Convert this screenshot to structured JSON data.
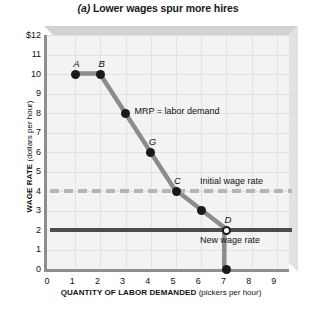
{
  "chart_data": {
    "type": "line",
    "title": "(a) Lower wages spur more hires",
    "title_prefix": "(a)",
    "title_rest": " Lower wages spur more hires",
    "xlabel_strong": "QUANTITY OF LABOR DEMANDED",
    "xlabel_unit": " (pickers per hour)",
    "ylabel_strong": "WAGE RATE",
    "ylabel_unit": " (dollars per hour)",
    "xlim": [
      0,
      9.6
    ],
    "ylim": [
      0,
      12
    ],
    "xticks": [
      "0",
      "1",
      "2",
      "3",
      "4",
      "5",
      "6",
      "7",
      "8",
      "9"
    ],
    "yticks": [
      "$12",
      "11",
      "10",
      "9",
      "8",
      "7",
      "6",
      "5",
      "4",
      "3",
      "2",
      "1",
      "0"
    ],
    "grid": true,
    "legend": "none",
    "series": [
      {
        "name": "MRP = labor demand",
        "color": "#8c8c8c",
        "x": [
          1,
          2,
          3,
          4,
          5,
          6,
          7,
          7
        ],
        "y": [
          10,
          10,
          8,
          6,
          4,
          3,
          2,
          0
        ]
      }
    ],
    "points": [
      {
        "label": "A",
        "x": 1,
        "y": 10,
        "style": "filled"
      },
      {
        "label": "B",
        "x": 2,
        "y": 10,
        "style": "filled"
      },
      {
        "label": "",
        "x": 3,
        "y": 8,
        "style": "filled"
      },
      {
        "label": "G",
        "x": 4,
        "y": 6,
        "style": "filled"
      },
      {
        "label": "C",
        "x": 5,
        "y": 4,
        "style": "filled"
      },
      {
        "label": "",
        "x": 6,
        "y": 3,
        "style": "filled"
      },
      {
        "label": "D",
        "x": 7,
        "y": 2,
        "style": "hollow"
      },
      {
        "label": "",
        "x": 7,
        "y": 0,
        "style": "filled"
      }
    ],
    "annotations": [
      {
        "name": "curve-annotation",
        "text": "MRP = labor demand",
        "x": 3.35,
        "y": 8.05
      }
    ],
    "reference_lines": [
      {
        "name": "initial-wage-rate",
        "label": "Initial wage rate",
        "y": 4,
        "style": "dashed",
        "color": "#b5b5b5"
      },
      {
        "name": "new-wage-rate",
        "label": "New wage rate",
        "y": 2,
        "style": "solid",
        "color": "#4d4d4d"
      }
    ]
  }
}
